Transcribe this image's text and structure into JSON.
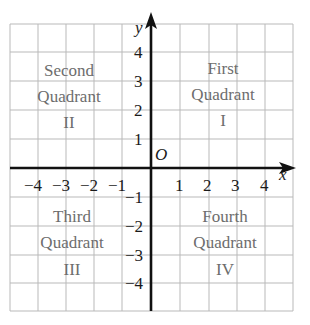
{
  "diagram": {
    "type": "cartesian-coordinate-plane",
    "x_range": [
      -5,
      5
    ],
    "y_range": [
      -5,
      5
    ],
    "grid": true,
    "axes": {
      "x_label": "x",
      "y_label": "y",
      "origin_label": "O"
    },
    "x_ticks": [
      {
        "value": -4,
        "label": "−4"
      },
      {
        "value": -3,
        "label": "−3"
      },
      {
        "value": -2,
        "label": "−2"
      },
      {
        "value": -1,
        "label": "−1"
      },
      {
        "value": 1,
        "label": "1"
      },
      {
        "value": 2,
        "label": "2"
      },
      {
        "value": 3,
        "label": "3"
      },
      {
        "value": 4,
        "label": "4"
      }
    ],
    "y_ticks": [
      {
        "value": 4,
        "label": "4"
      },
      {
        "value": 3,
        "label": "3"
      },
      {
        "value": 2,
        "label": "2"
      },
      {
        "value": 1,
        "label": "1"
      },
      {
        "value": -1,
        "label": "−1"
      },
      {
        "value": -2,
        "label": "−2"
      },
      {
        "value": -3,
        "label": "−3"
      },
      {
        "value": -4,
        "label": "−4"
      }
    ],
    "quadrants": {
      "first": {
        "line1": "First",
        "line2": "Quadrant",
        "numeral": "I"
      },
      "second": {
        "line1": "Second",
        "line2": "Quadrant",
        "numeral": "II"
      },
      "third": {
        "line1": "Third",
        "line2": "Quadrant",
        "numeral": "III"
      },
      "fourth": {
        "line1": "Fourth",
        "line2": "Quadrant",
        "numeral": "IV"
      }
    },
    "colors": {
      "grid": "#b9b9b9",
      "axes": "#111111",
      "labels": "#1a1a1a",
      "quadrant_text": "#6d6d6d",
      "background": "#ffffff"
    }
  }
}
